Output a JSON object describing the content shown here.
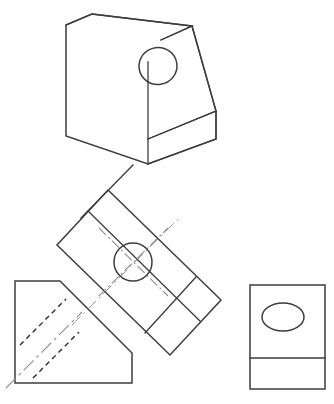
{
  "sheet": {
    "title": "Multiview Engineering Drawing - Inclined Wedge Block with Through Hole",
    "background_color": "#ffffff",
    "line_color": "#3d3d3d",
    "hidden_line_color": "#2b2b2b",
    "center_line_color": "#8e8e8e",
    "width": 334,
    "height": 404
  },
  "views": {
    "isometric": {
      "name": "Isometric Pictorial View",
      "label": "",
      "description": "Wedge shaped block with inclined top face containing a circular through hole",
      "top_face_points": "66,25 92,14 192,26 161,40",
      "left_face_points": "66,25 66,136 148,164 148,62",
      "inclined_face_points": "161,40 192,26 216,111 148,139",
      "front_band_points": "148,139 216,111 216,139 148,164",
      "outline_points": "66,25 92,14 192,26 216,111 216,139 148,164 66,136",
      "hole": {
        "cx": 158,
        "cy": 66,
        "rx": 19,
        "ry": 18.5,
        "rotation": -8
      }
    },
    "auxiliary": {
      "name": "Auxiliary View (Rotated)",
      "label": "",
      "description": "True shape view of inclined face, rotated approximately 38 degrees, with circular hole and centerlines",
      "rotation_deg": 38,
      "rect_points": "108,190 221,300 170,355 57,245",
      "inner_line_1": "88,211 200,321",
      "inner_line_2": "145,333 196,277",
      "inner_line_3": "81,218 133,165",
      "hole": {
        "cx": 133,
        "cy": 262,
        "r": 19
      },
      "centerline_a": "101,294 166,230",
      "centerline_b": "101,230 166,294"
    },
    "front": {
      "name": "Front View",
      "label": "",
      "description": "Front orthographic view showing inclined surface and hidden hole lines",
      "outline_points": "15,281 60,281 132,353 132,383 15,383",
      "hidden_line_1": "20,345 66,299",
      "hidden_line_2": "33,378 79,332",
      "center_line": "6,388 82,312"
    },
    "right": {
      "name": "Right Side View",
      "label": "",
      "description": "Right side orthographic view with elliptical hole projection and horizontal division line",
      "rect": {
        "x": 250,
        "y": 285,
        "width": 75,
        "height": 104
      },
      "divider_line": "250,358 325,358",
      "hole_ellipse": {
        "cx": 283,
        "cy": 317,
        "rx": 21,
        "ry": 14
      }
    }
  },
  "geometry_notes": {
    "projection_type": "Third angle orthographic with auxiliary view",
    "hole_count": 1,
    "hidden_line_count": 2,
    "center_line_count": 3
  }
}
